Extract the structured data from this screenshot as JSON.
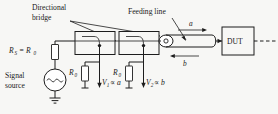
{
  "figure": {
    "background_color": "#f7f7f5",
    "line_color": "#1d1d1d"
  },
  "labels": {
    "directional_bridge_line1": "Directional",
    "directional_bridge_line2": "bridge",
    "feeding_line": "Feeding line",
    "signal_source_line1": "Signal",
    "signal_source_line2": "source",
    "dut": "DUT",
    "source_impedance": "R",
    "source_impedance_sub": "S",
    "source_impedance_eq": "= R",
    "source_impedance_eq_sub": "0",
    "resistor1": "R",
    "resistor1_sub": "0",
    "resistor2": "R",
    "resistor2_sub": "0",
    "v1": "V",
    "v1_sub": "1",
    "v1_rel": "∝ a",
    "v2": "V",
    "v2_sub": "2",
    "v2_rel": "∝ b",
    "wave_incident": "a",
    "wave_reflected": "b"
  },
  "components": [
    {
      "name": "signal-source",
      "type": "ac-source",
      "label": "Signal source"
    },
    {
      "name": "source-resistor",
      "type": "resistor",
      "label": "R_S = R_0"
    },
    {
      "name": "directional-coupler-1",
      "type": "coupler-box",
      "label": ""
    },
    {
      "name": "directional-coupler-2",
      "type": "coupler-box",
      "label": ""
    },
    {
      "name": "termination-resistor-1",
      "type": "resistor",
      "label": "R_0"
    },
    {
      "name": "termination-resistor-2",
      "type": "resistor",
      "label": "R_0"
    },
    {
      "name": "feeding-line",
      "type": "transmission-line",
      "label": "Feeding line"
    },
    {
      "name": "device-under-test",
      "type": "box",
      "label": "DUT"
    }
  ],
  "annotations": [
    {
      "name": "incident-wave-arrow",
      "label": "a",
      "direction": "right"
    },
    {
      "name": "reflected-wave-arrow",
      "label": "b",
      "direction": "left"
    },
    {
      "name": "v1-probe-arrow",
      "label": "V1 ∝ a",
      "direction": "down"
    },
    {
      "name": "v2-probe-arrow",
      "label": "V2 ∝ b",
      "direction": "down"
    }
  ]
}
